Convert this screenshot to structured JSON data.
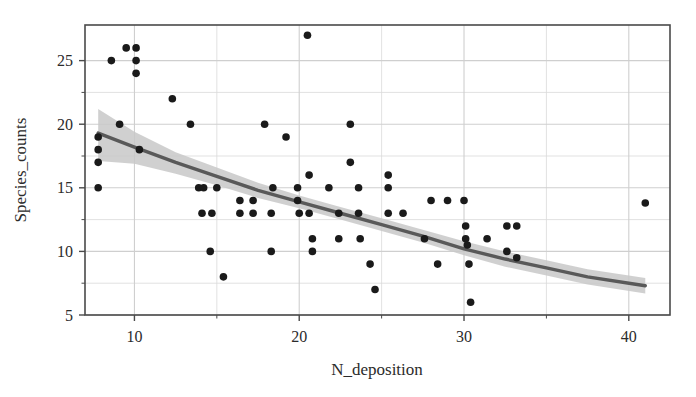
{
  "chart_data": {
    "type": "scatter",
    "title": "",
    "xlabel": "N_deposition",
    "ylabel": "Species_counts",
    "xlim": [
      7.0,
      42.5
    ],
    "ylim": [
      5.0,
      27.8
    ],
    "xticks": [
      10,
      20,
      30,
      40
    ],
    "yticks": [
      5,
      10,
      15,
      20,
      25
    ],
    "xminor_ticks": [
      15,
      25,
      35
    ],
    "yminor_ticks": [
      7.5,
      12.5,
      17.5,
      22.5
    ],
    "grid": true,
    "legend": "none",
    "point_color": "#1a1a1a",
    "point_size": 7,
    "line_color": "#595959",
    "band_color": "#c8c8c8",
    "grid_color": "#d9d9d9",
    "frame_color": "#4a4a4a",
    "points": [
      {
        "x": 7.8,
        "y": 19.0
      },
      {
        "x": 7.8,
        "y": 18.0
      },
      {
        "x": 7.8,
        "y": 17.0
      },
      {
        "x": 7.8,
        "y": 15.0
      },
      {
        "x": 8.6,
        "y": 25.0
      },
      {
        "x": 9.1,
        "y": 20.0
      },
      {
        "x": 9.5,
        "y": 26.0
      },
      {
        "x": 10.1,
        "y": 26.0
      },
      {
        "x": 10.1,
        "y": 25.0
      },
      {
        "x": 10.1,
        "y": 24.0
      },
      {
        "x": 10.3,
        "y": 18.0
      },
      {
        "x": 12.3,
        "y": 22.0
      },
      {
        "x": 13.4,
        "y": 20.0
      },
      {
        "x": 13.9,
        "y": 15.0
      },
      {
        "x": 14.2,
        "y": 15.0
      },
      {
        "x": 14.1,
        "y": 13.0
      },
      {
        "x": 14.7,
        "y": 13.0
      },
      {
        "x": 14.6,
        "y": 10.0
      },
      {
        "x": 15.0,
        "y": 15.0
      },
      {
        "x": 15.4,
        "y": 8.0
      },
      {
        "x": 16.4,
        "y": 14.0
      },
      {
        "x": 16.4,
        "y": 13.0
      },
      {
        "x": 17.2,
        "y": 14.0
      },
      {
        "x": 17.2,
        "y": 13.0
      },
      {
        "x": 17.9,
        "y": 20.0
      },
      {
        "x": 18.4,
        "y": 15.0
      },
      {
        "x": 18.3,
        "y": 13.0
      },
      {
        "x": 18.3,
        "y": 10.0
      },
      {
        "x": 19.2,
        "y": 19.0
      },
      {
        "x": 19.9,
        "y": 15.0
      },
      {
        "x": 19.9,
        "y": 14.0
      },
      {
        "x": 20.0,
        "y": 13.0
      },
      {
        "x": 20.5,
        "y": 27.0
      },
      {
        "x": 20.6,
        "y": 16.0
      },
      {
        "x": 20.6,
        "y": 13.0
      },
      {
        "x": 20.8,
        "y": 11.0
      },
      {
        "x": 20.8,
        "y": 10.0
      },
      {
        "x": 21.8,
        "y": 15.0
      },
      {
        "x": 22.4,
        "y": 13.0
      },
      {
        "x": 22.4,
        "y": 11.0
      },
      {
        "x": 23.1,
        "y": 20.0
      },
      {
        "x": 23.1,
        "y": 17.0
      },
      {
        "x": 23.6,
        "y": 15.0
      },
      {
        "x": 23.6,
        "y": 13.0
      },
      {
        "x": 23.7,
        "y": 11.0
      },
      {
        "x": 24.3,
        "y": 9.0
      },
      {
        "x": 24.6,
        "y": 7.0
      },
      {
        "x": 25.4,
        "y": 16.0
      },
      {
        "x": 25.4,
        "y": 15.0
      },
      {
        "x": 25.4,
        "y": 13.0
      },
      {
        "x": 26.3,
        "y": 13.0
      },
      {
        "x": 27.6,
        "y": 11.0
      },
      {
        "x": 28.0,
        "y": 14.0
      },
      {
        "x": 29.0,
        "y": 14.0
      },
      {
        "x": 28.4,
        "y": 9.0
      },
      {
        "x": 30.0,
        "y": 14.0
      },
      {
        "x": 30.1,
        "y": 12.0
      },
      {
        "x": 30.1,
        "y": 11.0
      },
      {
        "x": 30.2,
        "y": 10.5
      },
      {
        "x": 30.3,
        "y": 9.0
      },
      {
        "x": 30.4,
        "y": 6.0
      },
      {
        "x": 31.4,
        "y": 11.0
      },
      {
        "x": 32.6,
        "y": 12.0
      },
      {
        "x": 32.6,
        "y": 10.0
      },
      {
        "x": 33.2,
        "y": 12.0
      },
      {
        "x": 33.2,
        "y": 9.5
      },
      {
        "x": 41.0,
        "y": 13.8
      }
    ],
    "regression": {
      "kind": "smooth-fit",
      "x_start": 7.8,
      "x_end": 41.0,
      "fit_points": [
        {
          "x": 7.8,
          "y": 19.3
        },
        {
          "x": 10.0,
          "y": 18.2
        },
        {
          "x": 12.5,
          "y": 17.0
        },
        {
          "x": 15.0,
          "y": 15.9
        },
        {
          "x": 17.5,
          "y": 14.8
        },
        {
          "x": 20.0,
          "y": 13.9
        },
        {
          "x": 22.5,
          "y": 13.0
        },
        {
          "x": 25.0,
          "y": 12.1
        },
        {
          "x": 27.5,
          "y": 11.2
        },
        {
          "x": 30.0,
          "y": 10.2
        },
        {
          "x": 32.5,
          "y": 9.4
        },
        {
          "x": 35.0,
          "y": 8.7
        },
        {
          "x": 37.5,
          "y": 8.0
        },
        {
          "x": 41.0,
          "y": 7.3
        }
      ],
      "ci_upper": [
        {
          "x": 7.8,
          "y": 21.2
        },
        {
          "x": 10.0,
          "y": 19.4
        },
        {
          "x": 12.5,
          "y": 17.8
        },
        {
          "x": 15.0,
          "y": 16.6
        },
        {
          "x": 17.5,
          "y": 15.4
        },
        {
          "x": 20.0,
          "y": 14.4
        },
        {
          "x": 22.5,
          "y": 13.5
        },
        {
          "x": 25.0,
          "y": 12.6
        },
        {
          "x": 27.5,
          "y": 11.7
        },
        {
          "x": 30.0,
          "y": 10.8
        },
        {
          "x": 32.5,
          "y": 10.0
        },
        {
          "x": 35.0,
          "y": 9.3
        },
        {
          "x": 37.5,
          "y": 8.6
        },
        {
          "x": 41.0,
          "y": 7.9
        }
      ],
      "ci_lower": [
        {
          "x": 7.8,
          "y": 17.1
        },
        {
          "x": 10.0,
          "y": 16.9
        },
        {
          "x": 12.5,
          "y": 16.1
        },
        {
          "x": 15.0,
          "y": 15.2
        },
        {
          "x": 17.5,
          "y": 14.2
        },
        {
          "x": 20.0,
          "y": 13.4
        },
        {
          "x": 22.5,
          "y": 12.5
        },
        {
          "x": 25.0,
          "y": 11.6
        },
        {
          "x": 27.5,
          "y": 10.7
        },
        {
          "x": 30.0,
          "y": 9.7
        },
        {
          "x": 32.5,
          "y": 8.8
        },
        {
          "x": 35.0,
          "y": 8.1
        },
        {
          "x": 37.5,
          "y": 7.4
        },
        {
          "x": 41.0,
          "y": 6.7
        }
      ]
    }
  }
}
